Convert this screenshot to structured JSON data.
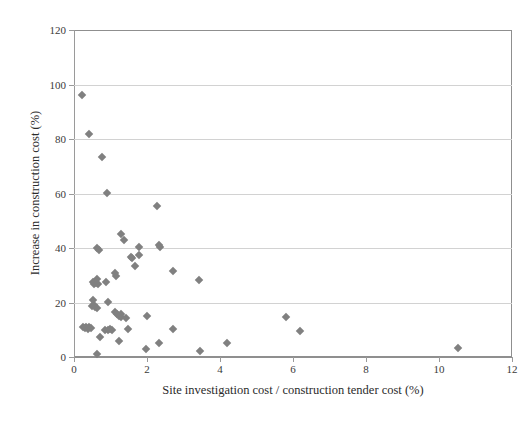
{
  "chart_data": {
    "type": "scatter",
    "title": "",
    "xlabel": "Site investigation cost / construction tender cost (%)",
    "ylabel": "Increase in construction cost (%)",
    "xlim": [
      0,
      12
    ],
    "ylim": [
      0,
      120
    ],
    "xticks": [
      0,
      2,
      4,
      6,
      8,
      10,
      12
    ],
    "yticks": [
      0,
      20,
      40,
      60,
      80,
      100,
      120
    ],
    "xtick_labels": [
      "0",
      "2",
      "4",
      "6",
      "8",
      "10",
      "12"
    ],
    "ytick_labels": [
      "0",
      "20",
      "40",
      "60",
      "80",
      "100",
      "120"
    ],
    "grid": "horizontal",
    "legend": null,
    "marker": {
      "shape": "diamond",
      "color": "#808080",
      "size_px": 6
    },
    "series": [
      {
        "name": "Projects",
        "color": "#808080",
        "points": [
          [
            0.22,
            96.2
          ],
          [
            0.42,
            82.0
          ],
          [
            0.78,
            73.3
          ],
          [
            0.9,
            60.2
          ],
          [
            2.28,
            55.3
          ],
          [
            1.28,
            45.3
          ],
          [
            1.36,
            42.8
          ],
          [
            0.64,
            40.0
          ],
          [
            0.68,
            39.3
          ],
          [
            1.78,
            40.3
          ],
          [
            2.32,
            41.0
          ],
          [
            2.36,
            40.2
          ],
          [
            1.56,
            36.8
          ],
          [
            1.6,
            36.2
          ],
          [
            1.78,
            37.3
          ],
          [
            1.66,
            33.4
          ],
          [
            2.72,
            31.6
          ],
          [
            1.12,
            31.0
          ],
          [
            1.14,
            29.8
          ],
          [
            3.42,
            28.4
          ],
          [
            0.52,
            27.6
          ],
          [
            0.56,
            26.9
          ],
          [
            0.6,
            27.2
          ],
          [
            0.66,
            26.8
          ],
          [
            0.62,
            28.6
          ],
          [
            0.88,
            27.4
          ],
          [
            0.52,
            21.0
          ],
          [
            0.56,
            19.1
          ],
          [
            0.5,
            18.6
          ],
          [
            0.58,
            18.3
          ],
          [
            0.62,
            18.0
          ],
          [
            0.94,
            20.2
          ],
          [
            1.12,
            16.4
          ],
          [
            1.18,
            15.8
          ],
          [
            1.24,
            15.1
          ],
          [
            1.3,
            15.8
          ],
          [
            1.28,
            14.6
          ],
          [
            1.42,
            14.4
          ],
          [
            2.0,
            15.2
          ],
          [
            5.8,
            14.5
          ],
          [
            0.26,
            11.0
          ],
          [
            0.3,
            10.6
          ],
          [
            0.34,
            10.9
          ],
          [
            0.38,
            10.4
          ],
          [
            0.42,
            11.0
          ],
          [
            0.46,
            10.7
          ],
          [
            0.86,
            10.0
          ],
          [
            0.92,
            9.8
          ],
          [
            0.98,
            10.2
          ],
          [
            1.04,
            10.0
          ],
          [
            1.48,
            10.2
          ],
          [
            2.72,
            10.3
          ],
          [
            6.2,
            9.5
          ],
          [
            0.72,
            7.2
          ],
          [
            1.22,
            6.0
          ],
          [
            2.32,
            5.1
          ],
          [
            4.2,
            5.2
          ],
          [
            1.98,
            3.1
          ],
          [
            3.46,
            2.2
          ],
          [
            10.52,
            3.4
          ],
          [
            0.62,
            1.0
          ]
        ]
      }
    ]
  }
}
